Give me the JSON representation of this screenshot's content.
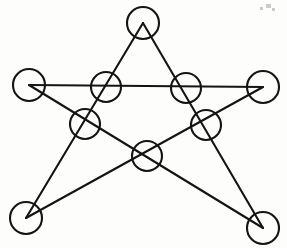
{
  "figure": {
    "kind": "line-drawing",
    "background_color": "#fdfdfc",
    "ink_color": "#141414",
    "stroke_width": 2.1,
    "canvas": {
      "width": 287,
      "height": 248
    }
  },
  "chart_data": {
    "type": "diagram",
    "points": [
      {
        "id": "P1",
        "role": "outer-vertex",
        "label": "top",
        "x": 143,
        "y": 23,
        "radius": 16
      },
      {
        "id": "P2",
        "role": "outer-vertex",
        "label": "right",
        "x": 263,
        "y": 87,
        "radius": 16
      },
      {
        "id": "P3",
        "role": "outer-vertex",
        "label": "bottom-right",
        "x": 263,
        "y": 228,
        "radius": 16
      },
      {
        "id": "P4",
        "role": "outer-vertex",
        "label": "bottom-left",
        "x": 26,
        "y": 218,
        "radius": 16
      },
      {
        "id": "P5",
        "role": "outer-vertex",
        "label": "left",
        "x": 29,
        "y": 85,
        "radius": 16
      },
      {
        "id": "I1",
        "role": "intersection",
        "label": "upper-left",
        "x": 106,
        "y": 87,
        "radius": 15
      },
      {
        "id": "I2",
        "role": "intersection",
        "label": "upper-right",
        "x": 186,
        "y": 88,
        "radius": 15
      },
      {
        "id": "I3",
        "role": "intersection",
        "label": "mid-left",
        "x": 85,
        "y": 124,
        "radius": 15
      },
      {
        "id": "I4",
        "role": "intersection",
        "label": "mid-right",
        "x": 206,
        "y": 125,
        "radius": 15
      },
      {
        "id": "I5",
        "role": "intersection",
        "label": "bottom-center",
        "x": 147,
        "y": 156,
        "radius": 15
      }
    ],
    "edges": [
      {
        "id": "E1",
        "from": "P1",
        "to": "P3",
        "passes_through": [
          "I2",
          "I4"
        ]
      },
      {
        "id": "E2",
        "from": "P3",
        "to": "P5",
        "passes_through": [
          "I5",
          "I3"
        ]
      },
      {
        "id": "E3",
        "from": "P5",
        "to": "P2",
        "passes_through": [
          "I1",
          "I2"
        ]
      },
      {
        "id": "E4",
        "from": "P2",
        "to": "P4",
        "passes_through": [
          "I4",
          "I5"
        ]
      },
      {
        "id": "E5",
        "from": "P4",
        "to": "P1",
        "passes_through": [
          "I3",
          "I1"
        ]
      }
    ],
    "counts": {
      "outer_vertices": 5,
      "intersections": 5,
      "circles_total": 10,
      "lines_total": 5
    },
    "legend": [],
    "annotations": []
  },
  "artifacts": [
    {
      "id": "A1",
      "label": "scan-speck",
      "x": 266,
      "y": 4,
      "width": 5,
      "height": 4
    },
    {
      "id": "A2",
      "label": "scan-speck",
      "x": 260,
      "y": 7,
      "width": 3,
      "height": 3
    },
    {
      "id": "A3",
      "label": "scan-speck",
      "x": 272,
      "y": 8,
      "width": 3,
      "height": 3
    }
  ]
}
